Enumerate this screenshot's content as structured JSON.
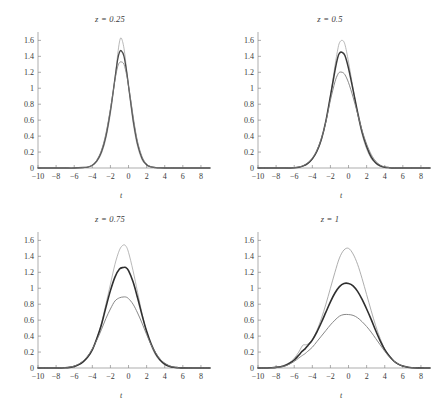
{
  "figure": {
    "background": "#ffffff",
    "axis_color": "#8a8a8a",
    "tick_label_color": "#3a3a3a",
    "xlabel": "t",
    "panel_layout": "2x2"
  },
  "chart_data": [
    {
      "type": "line",
      "title": "z = 0.25",
      "xlabel": "t",
      "ylabel": "",
      "xlim": [
        -10,
        9
      ],
      "ylim": [
        0,
        1.68
      ],
      "xticks": [
        -10,
        -8,
        -6,
        -4,
        -2,
        0,
        2,
        4,
        6,
        8
      ],
      "yticks": [
        0,
        0.2,
        0.4,
        0.6,
        0.8,
        1,
        1.2,
        1.4,
        1.6
      ],
      "xticklabels": [
        "-10",
        "-8",
        "-6",
        "-4",
        "-2",
        "0",
        "2",
        "4",
        "6",
        "8"
      ],
      "yticklabels": [
        "0",
        "0.2",
        "0.4",
        "0.6",
        "0.8",
        "1",
        "1.2",
        "1.4",
        "1.6"
      ],
      "grid": false,
      "legend": "none",
      "x": [
        -10,
        -9,
        -8,
        -7,
        -6,
        -5,
        -4.5,
        -4,
        -3.5,
        -3,
        -2.5,
        -2,
        -1.5,
        -1.2,
        -1,
        -0.8,
        -0.5,
        -0.2,
        0,
        0.3,
        0.6,
        1,
        1.5,
        2,
        2.5,
        3,
        3.5,
        4,
        5,
        6,
        7,
        8,
        9
      ],
      "series": [
        {
          "name": "curve-1",
          "color": "#999999",
          "width": 0.7,
          "peak": 1.63,
          "values": [
            0,
            0,
            0,
            0,
            0,
            0.005,
            0.01,
            0.03,
            0.08,
            0.18,
            0.37,
            0.68,
            1.12,
            1.42,
            1.58,
            1.63,
            1.5,
            1.22,
            1.02,
            0.74,
            0.5,
            0.27,
            0.1,
            0.035,
            0.012,
            0.004,
            0.001,
            0,
            0,
            0,
            0,
            0,
            0
          ]
        },
        {
          "name": "curve-2",
          "color": "#4a4a4a",
          "width": 1.3,
          "peak": 1.47,
          "values": [
            0,
            0,
            0,
            0,
            0,
            0.006,
            0.012,
            0.035,
            0.09,
            0.2,
            0.4,
            0.72,
            1.12,
            1.36,
            1.45,
            1.47,
            1.4,
            1.2,
            1.03,
            0.78,
            0.54,
            0.3,
            0.12,
            0.04,
            0.014,
            0.005,
            0.001,
            0,
            0,
            0,
            0,
            0,
            0
          ]
        },
        {
          "name": "curve-3",
          "color": "#7a7a7a",
          "width": 0.8,
          "peak": 1.33,
          "values": [
            0,
            0,
            0,
            0,
            0,
            0.006,
            0.013,
            0.038,
            0.1,
            0.22,
            0.43,
            0.74,
            1.1,
            1.27,
            1.32,
            1.33,
            1.3,
            1.16,
            1.03,
            0.81,
            0.58,
            0.33,
            0.14,
            0.05,
            0.016,
            0.005,
            0.001,
            0,
            0,
            0,
            0,
            0,
            0
          ]
        }
      ]
    },
    {
      "type": "line",
      "title": "z = 0.5",
      "xlabel": "t",
      "ylabel": "",
      "xlim": [
        -10,
        9
      ],
      "ylim": [
        0,
        1.68
      ],
      "xticks": [
        -10,
        -8,
        -6,
        -4,
        -2,
        0,
        2,
        4,
        6,
        8
      ],
      "yticks": [
        0,
        0.2,
        0.4,
        0.6,
        0.8,
        1,
        1.2,
        1.4,
        1.6
      ],
      "xticklabels": [
        "-10",
        "-8",
        "-6",
        "-4",
        "-2",
        "0",
        "2",
        "4",
        "6",
        "8"
      ],
      "yticklabels": [
        "0",
        "0.2",
        "0.4",
        "0.6",
        "0.8",
        "1",
        "1.2",
        "1.4",
        "1.6"
      ],
      "grid": false,
      "legend": "none",
      "x": [
        -10,
        -9,
        -8,
        -7,
        -6,
        -5.5,
        -5,
        -4.5,
        -4,
        -3.5,
        -3,
        -2.5,
        -2,
        -1.5,
        -1.2,
        -1,
        -0.7,
        -0.4,
        0,
        0.5,
        1,
        1.5,
        2,
        2.5,
        3,
        3.5,
        4,
        4.5,
        5,
        6,
        7,
        8,
        9
      ],
      "series": [
        {
          "name": "curve-1",
          "color": "#999999",
          "width": 0.7,
          "peak": 1.6,
          "values": [
            0,
            0,
            0,
            0,
            0.004,
            0.01,
            0.025,
            0.055,
            0.11,
            0.2,
            0.35,
            0.58,
            0.9,
            1.28,
            1.48,
            1.57,
            1.6,
            1.55,
            1.33,
            1.0,
            0.68,
            0.42,
            0.24,
            0.12,
            0.055,
            0.022,
            0.008,
            0.003,
            0.001,
            0,
            0,
            0,
            0
          ]
        },
        {
          "name": "curve-2",
          "color": "#3a3a3a",
          "width": 1.5,
          "peak": 1.45,
          "values": [
            0,
            0,
            0,
            0,
            0.004,
            0.01,
            0.026,
            0.058,
            0.115,
            0.21,
            0.36,
            0.59,
            0.9,
            1.22,
            1.38,
            1.44,
            1.45,
            1.41,
            1.25,
            0.98,
            0.7,
            0.45,
            0.27,
            0.14,
            0.065,
            0.027,
            0.01,
            0.004,
            0.001,
            0,
            0,
            0,
            0
          ]
        },
        {
          "name": "curve-3",
          "color": "#7a7a7a",
          "width": 0.9,
          "peak": 1.2,
          "values": [
            0,
            0,
            0,
            0,
            0.005,
            0.012,
            0.03,
            0.065,
            0.125,
            0.22,
            0.37,
            0.58,
            0.85,
            1.08,
            1.17,
            1.2,
            1.2,
            1.17,
            1.07,
            0.89,
            0.68,
            0.47,
            0.3,
            0.17,
            0.085,
            0.037,
            0.015,
            0.005,
            0.002,
            0,
            0,
            0,
            0
          ]
        }
      ]
    },
    {
      "type": "line",
      "title": "z = 0.75",
      "xlabel": "t",
      "ylabel": "",
      "xlim": [
        -10,
        9
      ],
      "ylim": [
        0,
        1.68
      ],
      "xticks": [
        -10,
        -8,
        -6,
        -4,
        -2,
        0,
        2,
        4,
        6,
        8
      ],
      "yticks": [
        0,
        0.2,
        0.4,
        0.6,
        0.8,
        1,
        1.2,
        1.4,
        1.6
      ],
      "xticklabels": [
        "-10",
        "-8",
        "-6",
        "-4",
        "-2",
        "0",
        "2",
        "4",
        "6",
        "8"
      ],
      "yticklabels": [
        "0",
        "0.2",
        "0.4",
        "0.6",
        "0.8",
        "1",
        "1.2",
        "1.4",
        "1.6"
      ],
      "grid": false,
      "legend": "none",
      "x": [
        -10,
        -9,
        -8,
        -7,
        -6.5,
        -6,
        -5.5,
        -5,
        -4.5,
        -4,
        -3.5,
        -3,
        -2.5,
        -2,
        -1.5,
        -1,
        -0.6,
        -0.3,
        0,
        0.5,
        1,
        1.5,
        2,
        2.5,
        3,
        3.5,
        4,
        4.5,
        5,
        5.5,
        6,
        7,
        8,
        9
      ],
      "series": [
        {
          "name": "curve-1",
          "color": "#999999",
          "width": 0.7,
          "peak": 1.54,
          "values": [
            0,
            0,
            0,
            0.003,
            0.008,
            0.02,
            0.04,
            0.075,
            0.13,
            0.22,
            0.37,
            0.56,
            0.8,
            1.05,
            1.3,
            1.48,
            1.54,
            1.53,
            1.45,
            1.22,
            0.95,
            0.68,
            0.45,
            0.28,
            0.16,
            0.085,
            0.04,
            0.018,
            0.007,
            0.003,
            0.001,
            0,
            0,
            0
          ]
        },
        {
          "name": "curve-2",
          "color": "#2f2f2f",
          "width": 1.6,
          "peak": 1.26,
          "values": [
            0,
            0,
            0,
            0.003,
            0.008,
            0.02,
            0.042,
            0.08,
            0.14,
            0.23,
            0.37,
            0.54,
            0.76,
            0.97,
            1.14,
            1.24,
            1.26,
            1.26,
            1.22,
            1.08,
            0.88,
            0.66,
            0.46,
            0.3,
            0.18,
            0.1,
            0.05,
            0.023,
            0.009,
            0.004,
            0.001,
            0,
            0,
            0
          ]
        },
        {
          "name": "curve-3",
          "color": "#7a7a7a",
          "width": 0.9,
          "peak": 0.89,
          "values": [
            0,
            0,
            0,
            0.004,
            0.01,
            0.024,
            0.05,
            0.09,
            0.15,
            0.24,
            0.35,
            0.48,
            0.62,
            0.74,
            0.84,
            0.88,
            0.89,
            0.89,
            0.87,
            0.8,
            0.69,
            0.56,
            0.42,
            0.29,
            0.19,
            0.11,
            0.06,
            0.028,
            0.012,
            0.005,
            0.002,
            0,
            0,
            0
          ]
        }
      ]
    },
    {
      "type": "line",
      "title": "z = 1",
      "xlabel": "t",
      "ylabel": "",
      "xlim": [
        -10,
        9
      ],
      "ylim": [
        0,
        1.68
      ],
      "xticks": [
        -10,
        -8,
        -6,
        -4,
        -2,
        0,
        2,
        4,
        6,
        8
      ],
      "yticks": [
        0,
        0.2,
        0.4,
        0.6,
        0.8,
        1,
        1.2,
        1.4,
        1.6
      ],
      "xticklabels": [
        "-10",
        "-8",
        "-6",
        "-4",
        "-2",
        "0",
        "2",
        "4",
        "6",
        "8"
      ],
      "yticklabels": [
        "0",
        "0.2",
        "0.4",
        "0.6",
        "0.8",
        "1",
        "1.2",
        "1.4",
        "1.6"
      ],
      "grid": false,
      "legend": "none",
      "annotation": "top curve shows a small shoulder bump near t = -5",
      "x": [
        -10,
        -9,
        -8.5,
        -8,
        -7.5,
        -7,
        -6.5,
        -6,
        -5.5,
        -5.2,
        -5,
        -4.8,
        -4.5,
        -4,
        -3.5,
        -3,
        -2.5,
        -2,
        -1.5,
        -1,
        -0.5,
        0,
        0.5,
        1,
        1.5,
        2,
        2.5,
        3,
        3.5,
        4,
        4.5,
        5,
        5.5,
        6,
        6.5,
        7,
        8,
        9
      ],
      "series": [
        {
          "name": "curve-1",
          "color": "#999999",
          "width": 0.8,
          "peak": 1.5,
          "values": [
            0,
            0,
            0.004,
            0.01,
            0.02,
            0.04,
            0.07,
            0.12,
            0.2,
            0.26,
            0.29,
            0.29,
            0.3,
            0.36,
            0.47,
            0.62,
            0.8,
            1.0,
            1.2,
            1.38,
            1.48,
            1.5,
            1.43,
            1.3,
            1.12,
            0.92,
            0.72,
            0.53,
            0.37,
            0.24,
            0.15,
            0.085,
            0.045,
            0.022,
            0.01,
            0.004,
            0.001,
            0
          ]
        },
        {
          "name": "curve-2",
          "color": "#2f2f2f",
          "width": 1.6,
          "peak": 1.06,
          "values": [
            0,
            0,
            0.003,
            0.008,
            0.016,
            0.032,
            0.06,
            0.1,
            0.16,
            0.2,
            0.22,
            0.24,
            0.28,
            0.35,
            0.45,
            0.57,
            0.7,
            0.83,
            0.94,
            1.02,
            1.06,
            1.06,
            1.03,
            0.96,
            0.86,
            0.74,
            0.61,
            0.47,
            0.34,
            0.23,
            0.15,
            0.088,
            0.048,
            0.024,
            0.011,
            0.004,
            0.001,
            0
          ]
        },
        {
          "name": "curve-3",
          "color": "#7a7a7a",
          "width": 0.9,
          "peak": 0.67,
          "values": [
            0,
            0,
            0.003,
            0.007,
            0.014,
            0.027,
            0.05,
            0.082,
            0.125,
            0.15,
            0.165,
            0.18,
            0.21,
            0.26,
            0.33,
            0.4,
            0.47,
            0.54,
            0.6,
            0.65,
            0.67,
            0.67,
            0.66,
            0.63,
            0.58,
            0.52,
            0.45,
            0.37,
            0.29,
            0.21,
            0.14,
            0.088,
            0.05,
            0.026,
            0.012,
            0.005,
            0.001,
            0
          ]
        }
      ]
    }
  ]
}
